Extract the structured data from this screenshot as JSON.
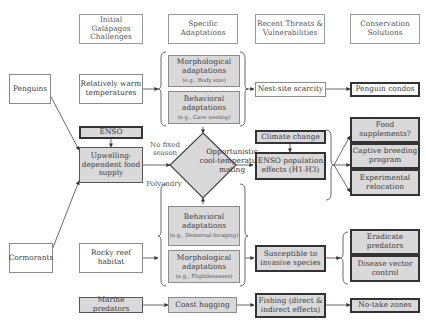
{
  "headers": {
    "col1": "Initial Galápagos Challenges",
    "col2": "Specific Adaptations",
    "col3": "Recent Threats & Vulnerabilities",
    "col4": "Conservation Solutions"
  },
  "species": {
    "penguins": "Penguins",
    "cormorants": "Cormorants"
  },
  "challenges": {
    "warm": "Relatively warm temperatures",
    "enso": "ENSO",
    "upwelling": "Upwelling-dependent food supply",
    "rocky": "Rocky reef habitat",
    "marine": "Marine predators"
  },
  "adaptations": {
    "penguin_morph": {
      "title": "Morphological adaptations",
      "example": "(e.g., Body size)"
    },
    "penguin_behav": {
      "title": "Behavioral adaptations",
      "example": "(e.g., Cave nesting)"
    },
    "diamond": "Opportunistic cool-temperature mating",
    "no_fixed_season": "No fixed season",
    "polyandry": "Polyandry",
    "corm_behav": {
      "title": "Behavioral adaptations",
      "example": "(e.g., Demersal foraging)"
    },
    "corm_morph": {
      "title": "Morphological adaptations",
      "example": "(e.g., Flightlessness)"
    },
    "coast": "Coast hugging"
  },
  "threats": {
    "nest": "Nest-site scarcity",
    "climate": "Climate change",
    "enso_effects": "ENSO population effects (H1-H3)",
    "invasive": "Susceptible to invasive species",
    "fishing": "Fishing (direct & indirect effects)"
  },
  "solutions": {
    "condos": "Penguin condos",
    "food": "Food supplements?",
    "captive": "Captive breeding program",
    "relocation": "Experimental relocation",
    "eradicate": "Eradicate predators",
    "disease": "Disease vector control",
    "notake": "No-take zones"
  },
  "colors": {
    "shaded_fill": "#d9d9d9",
    "border_dark": "#333333",
    "border_light": "#8a8a8a"
  }
}
